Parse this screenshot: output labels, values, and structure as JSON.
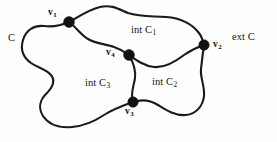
{
  "figure": {
    "type": "jordan-curve-diagram",
    "width": 277,
    "height": 142,
    "background_color": "#fefefe",
    "stroke_color": "#1a1a1a",
    "vertex_color": "#111111"
  },
  "labels": {
    "outer_curve": "C",
    "exterior": "ext C",
    "region_1_prefix": "int C",
    "region_1_sub": "1",
    "region_2_prefix": "int C",
    "region_2_sub": "2",
    "region_3_prefix": "int C",
    "region_3_sub": "3",
    "vertex_1_prefix": "v",
    "vertex_1_sub": "1",
    "vertex_2_prefix": "v",
    "vertex_2_sub": "2",
    "vertex_3_prefix": "v",
    "vertex_3_sub": "3",
    "vertex_4_prefix": "v",
    "vertex_4_sub": "4"
  },
  "vertices": [
    {
      "name": "v1",
      "x": 69,
      "y": 22,
      "radius": 5.4
    },
    {
      "name": "v2",
      "x": 204,
      "y": 45,
      "radius": 5.2
    },
    {
      "name": "v3",
      "x": 133,
      "y": 102,
      "radius": 5.2
    },
    {
      "name": "v4",
      "x": 129,
      "y": 55,
      "radius": 5.4
    }
  ],
  "arcs": {
    "top_v1_to_v2": "M69,22 C80,16 88,10 100,7 C112,4 120,10 128,13 C140,17 152,16 166,17 C180,18 192,24 199,33 C202,37 203,41 204,45",
    "left_lobe_v1_to_v3": "M69,22 C60,26 52,27 44,26 C34,25 26,30 23,40 C20,50 24,58 31,63 C38,68 46,69 51,75 C56,81 52,88 46,94 C40,100 38,108 43,116 C49,125 60,128 72,127 C84,126 95,121 104,115 C113,109 122,106 133,102",
    "bottom_right_v3_to_v2": "M133,102 C142,99 150,100 158,105 C166,110 175,116 186,115 C196,114 203,106 204,96 C205,86 200,78 201,69 C202,60 203,52 204,45",
    "inner_v1_to_v4": "M69,22 C76,27 80,34 88,39 C96,44 106,44 114,47 C120,49 125,52 129,55",
    "inner_v4_to_v2": "M129,55 C136,60 144,66 154,67 C164,68 175,62 184,55 C191,50 198,47 204,45",
    "inner_v4_to_v3": "M129,55 C133,62 136,70 135,78 C134,86 130,93 133,102"
  }
}
